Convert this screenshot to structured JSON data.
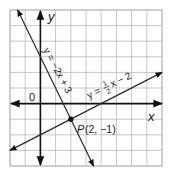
{
  "figure": {
    "grid": {
      "x_min": -2,
      "x_max": 8,
      "y_min": -4,
      "y_max": 6,
      "left": 10,
      "right": 162,
      "top": 10,
      "bottom": 166
    },
    "axes": {
      "x_label": "x",
      "y_label": "y",
      "origin_label": "0"
    },
    "lines": [
      {
        "id": "line1",
        "equation_label": "y = −2x + 3",
        "slope": -2,
        "intercept": 3
      },
      {
        "id": "line2",
        "equation_label_prefix": "y =",
        "fraction_num": "1",
        "fraction_den": "2",
        "equation_label_suffix": "x − 2",
        "slope": 0.5,
        "intercept": -2
      }
    ],
    "point": {
      "name": "P",
      "coords_label": "(2, −1)",
      "x": 2,
      "y": -1
    },
    "colors": {
      "grid": "#b8b8b8",
      "axis": "#111111",
      "line": "#2a2a2a",
      "background": "#ffffff"
    }
  }
}
